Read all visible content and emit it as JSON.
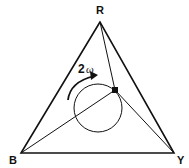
{
  "diagram": {
    "vertices": [
      {
        "label": "R",
        "x": 100,
        "y": 22
      },
      {
        "label": "B",
        "x": 21,
        "y": 153
      },
      {
        "label": "Y",
        "x": 174,
        "y": 153
      }
    ],
    "point": {
      "x": 115,
      "y": 90
    },
    "circle": {
      "cx": 98,
      "cy": 108,
      "r": 24
    },
    "rotation_label": {
      "number": "2",
      "symbol": "ω"
    },
    "stroke_color": "#111111"
  }
}
